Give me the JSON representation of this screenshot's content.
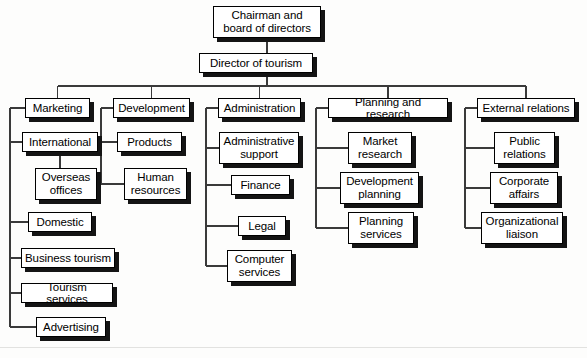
{
  "diagram": {
    "type": "organizational-chart",
    "background_color": "#fdfdfc",
    "box_fill": "#ffffff",
    "box_border_color": "#000000",
    "shadow_color": "#141414",
    "connector_color": "#3a3a3a"
  },
  "nodes": {
    "chairman": {
      "label": "Chairman and\nboard of directors",
      "level": 0,
      "x": 213,
      "y": 6,
      "w": 108,
      "h": 32
    },
    "director": {
      "label": "Director of tourism",
      "level": 1,
      "x": 199,
      "y": 53,
      "w": 114,
      "h": 20
    },
    "marketing": {
      "label": "Marketing",
      "level": 2,
      "x": 25,
      "y": 98,
      "w": 65,
      "h": 20
    },
    "international": {
      "label": "International",
      "level": 3,
      "x": 22,
      "y": 132,
      "w": 76,
      "h": 20
    },
    "overseas_offices": {
      "label": "Overseas\noffices",
      "level": 4,
      "x": 35,
      "y": 168,
      "w": 62,
      "h": 32
    },
    "domestic": {
      "label": "Domestic",
      "level": 3,
      "x": 28,
      "y": 212,
      "w": 64,
      "h": 20
    },
    "business_tourism": {
      "label": "Business tourism",
      "level": 3,
      "x": 21,
      "y": 248,
      "w": 94,
      "h": 20
    },
    "tourism_services": {
      "label": "Tourism services",
      "level": 3,
      "x": 21,
      "y": 283,
      "w": 92,
      "h": 20
    },
    "advertising": {
      "label": "Advertising",
      "level": 3,
      "x": 36,
      "y": 317,
      "w": 70,
      "h": 20
    },
    "development": {
      "label": "Development",
      "level": 2,
      "x": 113,
      "y": 98,
      "w": 77,
      "h": 20
    },
    "products": {
      "label": "Products",
      "level": 3,
      "x": 117,
      "y": 132,
      "w": 65,
      "h": 20
    },
    "human_resources": {
      "label": "Human\nresources",
      "level": 3,
      "x": 124,
      "y": 168,
      "w": 63,
      "h": 32
    },
    "administration": {
      "label": "Administration",
      "level": 2,
      "x": 218,
      "y": 98,
      "w": 83,
      "h": 20
    },
    "administrative_support": {
      "label": "Administrative\nsupport",
      "level": 3,
      "x": 219,
      "y": 132,
      "w": 80,
      "h": 32
    },
    "finance": {
      "label": "Finance",
      "level": 3,
      "x": 231,
      "y": 175,
      "w": 59,
      "h": 20
    },
    "legal": {
      "label": "Legal",
      "level": 3,
      "x": 238,
      "y": 216,
      "w": 48,
      "h": 20
    },
    "computer_services": {
      "label": "Computer\nservices",
      "level": 3,
      "x": 227,
      "y": 250,
      "w": 65,
      "h": 32
    },
    "planning_research": {
      "label": "Planning and research",
      "level": 2,
      "x": 328,
      "y": 98,
      "w": 120,
      "h": 20
    },
    "market_research": {
      "label": "Market\nresearch",
      "level": 3,
      "x": 348,
      "y": 132,
      "w": 64,
      "h": 32
    },
    "development_planning": {
      "label": "Development\nplanning",
      "level": 3,
      "x": 340,
      "y": 172,
      "w": 79,
      "h": 32
    },
    "planning_services": {
      "label": "Planning\nservices",
      "level": 3,
      "x": 348,
      "y": 212,
      "w": 66,
      "h": 32
    },
    "external_relations": {
      "label": "External relations",
      "level": 2,
      "x": 477,
      "y": 98,
      "w": 98,
      "h": 20
    },
    "public_relations": {
      "label": "Public\nrelations",
      "level": 3,
      "x": 494,
      "y": 132,
      "w": 61,
      "h": 32
    },
    "corporate_affairs": {
      "label": "Corporate\naffairs",
      "level": 3,
      "x": 490,
      "y": 172,
      "w": 68,
      "h": 32
    },
    "organizational_liaison": {
      "label": "Organizational\nliaison",
      "level": 3,
      "x": 481,
      "y": 212,
      "w": 82,
      "h": 32
    }
  },
  "edges": [
    {
      "from": "chairman",
      "to": "director"
    },
    {
      "from": "director",
      "to": "bus"
    },
    {
      "from": "bus",
      "to": "marketing"
    },
    {
      "from": "bus",
      "to": "development"
    },
    {
      "from": "bus",
      "to": "administration"
    },
    {
      "from": "bus",
      "to": "planning_research"
    },
    {
      "from": "bus",
      "to": "external_relations"
    },
    {
      "from": "marketing",
      "to": "international"
    },
    {
      "from": "international",
      "to": "overseas_offices"
    },
    {
      "from": "marketing",
      "to": "domestic"
    },
    {
      "from": "marketing",
      "to": "business_tourism"
    },
    {
      "from": "marketing",
      "to": "tourism_services"
    },
    {
      "from": "marketing",
      "to": "advertising"
    },
    {
      "from": "development",
      "to": "products"
    },
    {
      "from": "development",
      "to": "human_resources"
    },
    {
      "from": "administration",
      "to": "administrative_support"
    },
    {
      "from": "administration",
      "to": "finance"
    },
    {
      "from": "administration",
      "to": "legal"
    },
    {
      "from": "administration",
      "to": "computer_services"
    },
    {
      "from": "planning_research",
      "to": "market_research"
    },
    {
      "from": "planning_research",
      "to": "development_planning"
    },
    {
      "from": "planning_research",
      "to": "planning_services"
    },
    {
      "from": "external_relations",
      "to": "public_relations"
    },
    {
      "from": "external_relations",
      "to": "corporate_affairs"
    },
    {
      "from": "external_relations",
      "to": "organizational_liaison"
    }
  ],
  "geometry": {
    "bus_y": 86,
    "spines": [
      {
        "name": "marketing-spine",
        "x": 10,
        "y1": 108,
        "y2": 327
      },
      {
        "name": "development-spine",
        "x": 101,
        "y1": 108,
        "y2": 184
      },
      {
        "name": "administration-spine",
        "x": 206,
        "y1": 108,
        "y2": 266
      },
      {
        "name": "planning-spine",
        "x": 316,
        "y1": 108,
        "y2": 228
      },
      {
        "name": "external-spine",
        "x": 465,
        "y1": 108,
        "y2": 228
      }
    ]
  }
}
